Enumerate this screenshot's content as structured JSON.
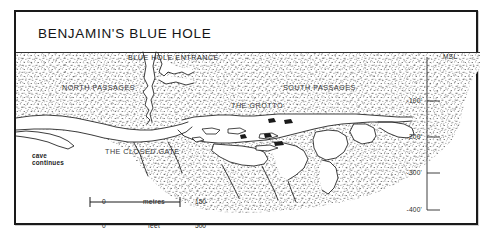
{
  "figure": {
    "title": "BENJAMIN'S BLUE HOLE",
    "type": "cave-cross-section-profile"
  },
  "surface": {
    "entrance_label": "BLUE HOLE ENTRANCE",
    "sea_level_label": "MSL"
  },
  "passages": {
    "north": "NORTH PASSAGES",
    "south": "SOUTH PASSAGES",
    "grotto": "THE GROTTO",
    "closed_gate": "THE CLOSED GATE"
  },
  "annotations": {
    "cave_continues_line1": "cave",
    "cave_continues_line2": "continues"
  },
  "depth_axis": {
    "unit": "feet",
    "ticks": [
      {
        "label": "-100'",
        "depth": 100
      },
      {
        "label": "-200'",
        "depth": 200
      },
      {
        "label": "-300'",
        "depth": 300
      },
      {
        "label": "-400'",
        "depth": 400
      }
    ]
  },
  "scale_bar": {
    "metric": {
      "min": "0",
      "unit": "metres",
      "max": "150"
    },
    "imperial": {
      "min": "0",
      "unit": "feet",
      "max": "500"
    }
  },
  "colors": {
    "ink": "#1a1a1a",
    "stipple": "#2b2b2b",
    "label": "#3a3a3a",
    "paper": "#ffffff"
  }
}
